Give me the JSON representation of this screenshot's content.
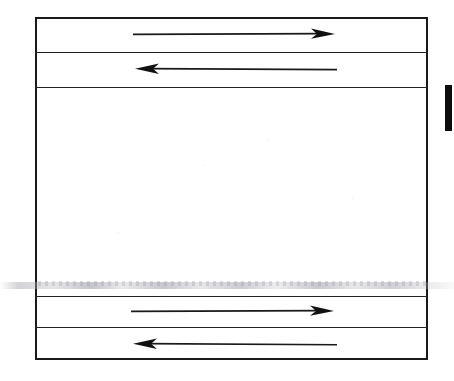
{
  "document": {
    "kind": "scanned-line-diagram",
    "background_color": "#ffffff",
    "ink_color": "#1a1a1a",
    "caption": "",
    "title": ""
  },
  "diagram": {
    "outer_rectangle": {
      "name": "outer-rectangle",
      "x": 35,
      "y": 17,
      "width": 393,
      "height": 343,
      "stroke_color": "#1a1a1a",
      "stroke_width": 2.2,
      "fill": "none"
    },
    "dividers": [
      {
        "name": "divider-1",
        "y": 52,
        "stroke_color": "#222222",
        "stroke_width": 1.8
      },
      {
        "name": "divider-2",
        "y": 87,
        "stroke_color": "#222222",
        "stroke_width": 1.8
      },
      {
        "name": "divider-3",
        "y": 296,
        "stroke_color": "#222222",
        "stroke_width": 1.8
      },
      {
        "name": "divider-4",
        "y": 327,
        "stroke_color": "#222222",
        "stroke_width": 1.8
      }
    ],
    "bands": [
      {
        "name": "band-top-1",
        "top": 17,
        "bottom": 52,
        "content": "arrow-right-1"
      },
      {
        "name": "band-top-2",
        "top": 52,
        "bottom": 87,
        "content": "arrow-left-1"
      },
      {
        "name": "band-middle",
        "top": 87,
        "bottom": 296,
        "content": "empty"
      },
      {
        "name": "band-bottom-1",
        "top": 296,
        "bottom": 327,
        "content": "arrow-right-2"
      },
      {
        "name": "band-bottom-2",
        "top": 327,
        "bottom": 360,
        "content": "arrow-left-2"
      }
    ],
    "arrows": [
      {
        "name": "arrow-right-1",
        "direction": "right",
        "band": "band-top-1",
        "x_start": 133,
        "x_end": 335,
        "y": 34,
        "stroke_color": "#1a1a1a",
        "label": ""
      },
      {
        "name": "arrow-left-1",
        "direction": "left",
        "band": "band-top-2",
        "x_start": 337,
        "x_end": 129,
        "y": 69,
        "stroke_color": "#1a1a1a",
        "label": ""
      },
      {
        "name": "arrow-right-2",
        "direction": "right",
        "band": "band-bottom-1",
        "x_start": 131,
        "x_end": 334,
        "y": 311,
        "stroke_color": "#1a1a1a",
        "label": ""
      },
      {
        "name": "arrow-left-2",
        "direction": "left",
        "band": "band-bottom-2",
        "x_start": 337,
        "x_end": 127,
        "y": 344,
        "stroke_color": "#1a1a1a",
        "label": ""
      }
    ]
  },
  "scan_artifacts": {
    "right_edge_bar": {
      "name": "scan-edge-bar",
      "x": 445,
      "y": 85,
      "width": 7,
      "height": 46,
      "color": "#0d0d0d"
    },
    "ghost_text_line": {
      "name": "ghost-text-smudge",
      "y": 283,
      "description": "faint illegible show-through text across page",
      "color": "#a8a8b2"
    }
  }
}
